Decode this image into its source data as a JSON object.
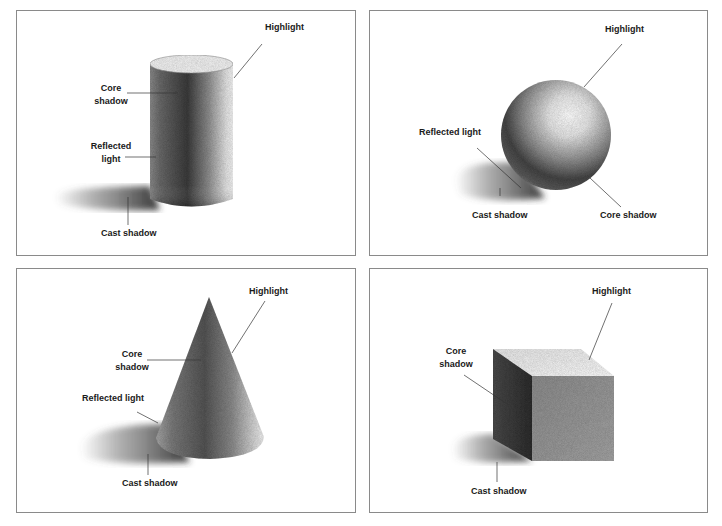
{
  "figure": {
    "panels": [
      {
        "id": "cylinder",
        "shape": "Cylinder",
        "labels": {
          "highlight": "Highlight",
          "core_shadow_1": "Core",
          "core_shadow_2": "shadow",
          "reflected_light_1": "Reflected",
          "reflected_light_2": "light",
          "cast_shadow": "Cast shadow"
        }
      },
      {
        "id": "sphere",
        "shape": "Sphere",
        "labels": {
          "highlight": "Highlight",
          "reflected_light": "Reflected light",
          "cast_shadow": "Cast shadow",
          "core_shadow": "Core shadow"
        }
      },
      {
        "id": "cone",
        "shape": "Cone",
        "labels": {
          "highlight": "Highlight",
          "core_shadow_1": "Core",
          "core_shadow_2": "shadow",
          "reflected_light": "Reflected light",
          "cast_shadow": "Cast shadow"
        }
      },
      {
        "id": "cube",
        "shape": "Cube",
        "labels": {
          "highlight": "Highlight",
          "core_shadow_1": "Core",
          "core_shadow_2": "shadow",
          "cast_shadow": "Cast shadow"
        }
      }
    ],
    "colors": {
      "border": "#8a8a8a",
      "leader_line": "#333333",
      "label_text": "#1a1a1a"
    }
  }
}
